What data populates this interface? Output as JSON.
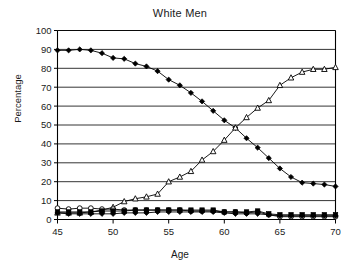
{
  "chart_data": {
    "type": "line",
    "title": "White Men",
    "xlabel": "Age",
    "ylabel": "Percentage",
    "xlim": [
      45,
      70
    ],
    "ylim": [
      0,
      100
    ],
    "grid": true,
    "legend": "none",
    "xticks": [
      45,
      50,
      55,
      60,
      65,
      70
    ],
    "yticks": [
      0,
      10,
      20,
      30,
      40,
      50,
      60,
      70,
      80,
      90,
      100
    ],
    "x": [
      45,
      46,
      47,
      48,
      49,
      50,
      51,
      52,
      53,
      54,
      55,
      56,
      57,
      58,
      59,
      60,
      61,
      62,
      63,
      64,
      65,
      66,
      67,
      68,
      69,
      70
    ],
    "series": [
      {
        "name": "series-declining-filled-diamond",
        "marker": "filled-diamond",
        "values": [
          89.5,
          89.5,
          90.0,
          89.5,
          88.0,
          85.5,
          85.0,
          82.5,
          81.0,
          78.5,
          74.0,
          71.0,
          67.0,
          62.5,
          57.5,
          52.5,
          48.5,
          43.0,
          38.0,
          32.5,
          27.0,
          22.5,
          19.5,
          19.0,
          18.5,
          17.5
        ]
      },
      {
        "name": "series-rising-open-triangle",
        "marker": "open-triangle",
        "values": [
          3.5,
          3.5,
          3.5,
          4.0,
          5.0,
          6.5,
          9.5,
          11.0,
          12.0,
          13.5,
          20.0,
          22.5,
          25.5,
          31.5,
          36.0,
          42.0,
          48.5,
          54.0,
          59.0,
          63.0,
          71.0,
          75.0,
          78.0,
          79.5,
          79.5,
          80.5
        ]
      },
      {
        "name": "series-flat-open-circle",
        "marker": "open-circle",
        "values": [
          6.0,
          5.5,
          6.0,
          6.0,
          5.5,
          5.5,
          5.0,
          5.0,
          5.0,
          5.0,
          5.0,
          5.0,
          4.5,
          4.5,
          4.5,
          4.0,
          4.0,
          3.5,
          4.0,
          2.5,
          1.5,
          1.5,
          1.5,
          1.5,
          1.5,
          1.5
        ]
      },
      {
        "name": "series-flat-filled-square",
        "marker": "filled-square",
        "values": [
          4.0,
          4.0,
          4.0,
          4.0,
          4.5,
          4.5,
          4.5,
          5.0,
          5.0,
          5.0,
          5.0,
          5.0,
          5.0,
          5.0,
          5.0,
          4.0,
          4.0,
          4.0,
          4.5,
          3.0,
          2.5,
          2.5,
          2.5,
          2.5,
          2.5,
          2.5
        ]
      },
      {
        "name": "series-flat-filled-diamond",
        "marker": "filled-diamond",
        "values": [
          3.5,
          3.0,
          3.0,
          3.0,
          3.0,
          3.0,
          3.5,
          3.5,
          3.5,
          4.0,
          4.0,
          4.0,
          4.0,
          4.0,
          4.0,
          3.5,
          3.0,
          3.0,
          3.0,
          2.5,
          2.0,
          2.0,
          2.0,
          2.0,
          2.0,
          2.0
        ]
      }
    ]
  },
  "colors": {
    "background": "#ffffff",
    "foreground": "#000000",
    "gridline": "#000000"
  }
}
